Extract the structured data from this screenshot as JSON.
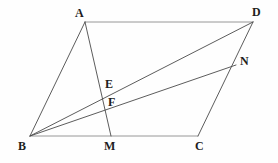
{
  "figure": {
    "background_color": "#fefefe",
    "line_color": "#4a4a4a",
    "light_line_color": "#8d8d8d",
    "label_color": "#1d1d1d",
    "points": {
      "A": {
        "label": "A",
        "x": 85,
        "y": 22,
        "label_x": 75,
        "label_y": 7
      },
      "D": {
        "label": "D",
        "x": 253,
        "y": 22,
        "label_x": 252,
        "label_y": 6
      },
      "B": {
        "label": "B",
        "x": 30,
        "y": 136,
        "label_x": 18,
        "label_y": 140
      },
      "C": {
        "label": "C",
        "x": 198,
        "y": 136,
        "label_x": 195,
        "label_y": 140
      },
      "M": {
        "label": "M",
        "x": 111,
        "y": 136,
        "label_x": 104,
        "label_y": 140
      },
      "N": {
        "label": "N",
        "x": 236,
        "y": 65,
        "label_x": 240,
        "label_y": 55
      },
      "E": {
        "label": "E",
        "x": 103,
        "y": 95,
        "label_x": 105,
        "label_y": 78
      },
      "F": {
        "label": "F",
        "x": 106,
        "y": 111,
        "label_x": 108,
        "label_y": 96
      }
    },
    "segments": [
      {
        "name": "segment-AD",
        "from": "A",
        "to": "D",
        "style": "light"
      },
      {
        "name": "segment-BC",
        "from": "B",
        "to": "C",
        "style": "light"
      },
      {
        "name": "segment-AB",
        "from": "A",
        "to": "B",
        "style": "dark"
      },
      {
        "name": "segment-AM",
        "from": "A",
        "to": "M",
        "style": "dark"
      },
      {
        "name": "segment-BD",
        "from": "B",
        "to": "D",
        "style": "dark"
      },
      {
        "name": "segment-BN",
        "from": "B",
        "to": "N",
        "style": "dark"
      },
      {
        "name": "segment-DC",
        "from": "D",
        "to": "C",
        "style": "dark"
      }
    ]
  }
}
